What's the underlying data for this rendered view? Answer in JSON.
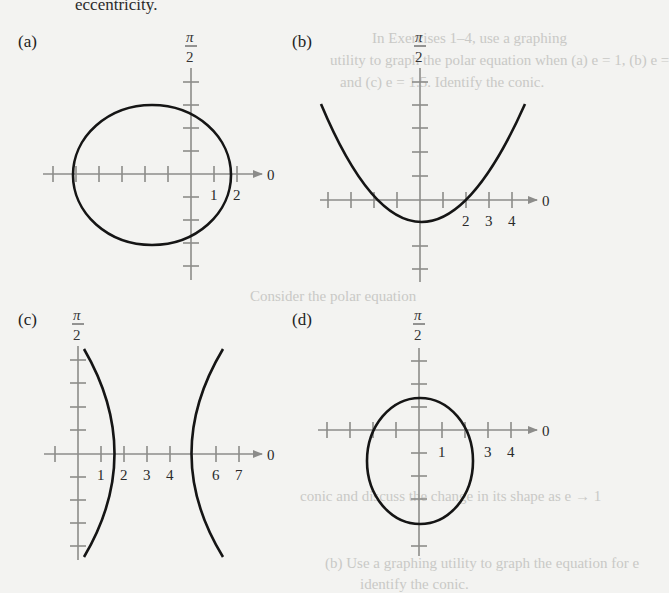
{
  "page": {
    "top_fragment": "eccentricity.",
    "ghost_text": [
      "In Exercises 1–4, use a graphing",
      "utility to graph the polar equation when (a) e = 1, (b) e =",
      "and (c) e = 1.5. Identify the conic.",
      "Consider the polar equation",
      "(a) Use a graphing utility to graph the equation for e",
      "conic and discuss the change in its shape as e → 1",
      "(b) Use a graphing utility to graph the equation for e",
      "identify the conic."
    ]
  },
  "panels": [
    {
      "id": "a",
      "label": "(a)",
      "angle_label": "π/2",
      "zero_label": "0",
      "tick_labels": [
        "1",
        "2"
      ],
      "curve": "ellipse"
    },
    {
      "id": "b",
      "label": "(b)",
      "angle_label": "π/2",
      "zero_label": "0",
      "tick_labels": [
        "2",
        "3",
        "4"
      ],
      "curve": "parabola"
    },
    {
      "id": "c",
      "label": "(c)",
      "angle_label": "π/2",
      "zero_label": "0",
      "tick_labels": [
        "1",
        "2",
        "3",
        "4",
        "6",
        "7"
      ],
      "curve": "hyperbola"
    },
    {
      "id": "d",
      "label": "(d)",
      "angle_label": "π/2",
      "zero_label": "0",
      "tick_labels": [
        "1",
        "3",
        "4"
      ],
      "curve": "ellipse"
    }
  ],
  "colors": {
    "axis": "#8c8c8a",
    "curve": "#151515",
    "background": "#f3f3f1",
    "ghost_text": "#c9c9c6"
  }
}
